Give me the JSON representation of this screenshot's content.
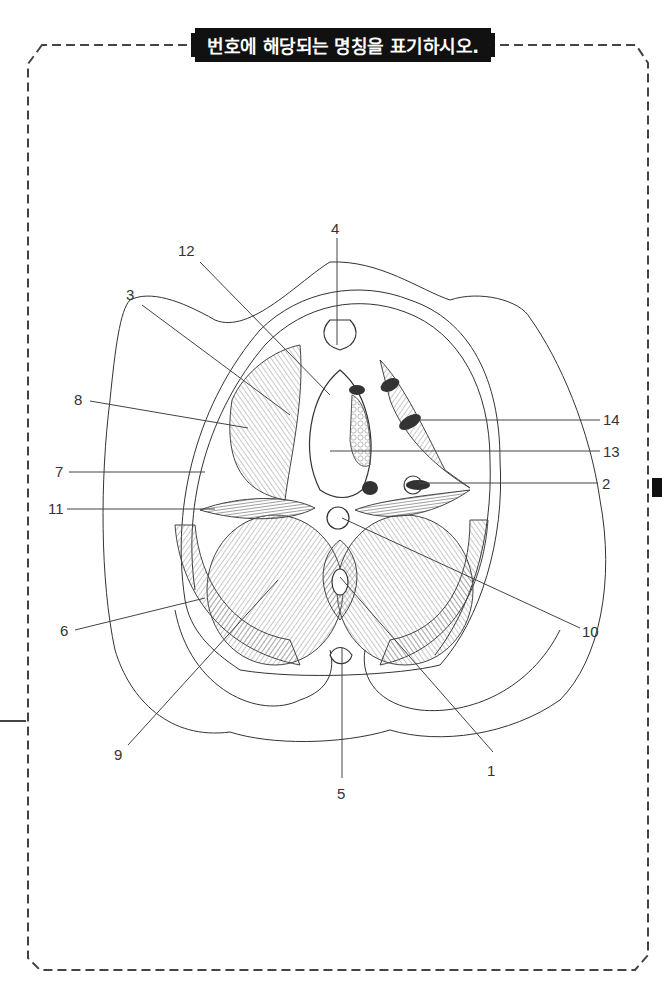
{
  "title": "번호에 해당되는 명칭을 표기하시오.",
  "diagram": {
    "labels": [
      {
        "id": "1",
        "text": "1",
        "x": 493,
        "y": 770
      },
      {
        "id": "2",
        "text": "2",
        "x": 602,
        "y": 489
      },
      {
        "id": "3",
        "text": "3",
        "x": 130,
        "y": 298
      },
      {
        "id": "4",
        "text": "4",
        "x": 333,
        "y": 234
      },
      {
        "id": "5",
        "text": "5",
        "x": 342,
        "y": 799
      },
      {
        "id": "6",
        "text": "6",
        "x": 63,
        "y": 636
      },
      {
        "id": "7",
        "text": "7",
        "x": 57,
        "y": 476
      },
      {
        "id": "8",
        "text": "8",
        "x": 76,
        "y": 404
      },
      {
        "id": "9",
        "text": "9",
        "x": 114,
        "y": 759
      },
      {
        "id": "10",
        "text": "10",
        "x": 583,
        "y": 636
      },
      {
        "id": "11",
        "text": "11",
        "x": 49,
        "y": 513
      },
      {
        "id": "12",
        "text": "12",
        "x": 180,
        "y": 254
      },
      {
        "id": "13",
        "text": "13",
        "x": 603,
        "y": 457
      },
      {
        "id": "14",
        "text": "14",
        "x": 603,
        "y": 425
      }
    ]
  },
  "colors": {
    "title_bg": "#111111",
    "title_text": "#ffffff",
    "frame_dash": "#444444",
    "line": "#333333"
  }
}
